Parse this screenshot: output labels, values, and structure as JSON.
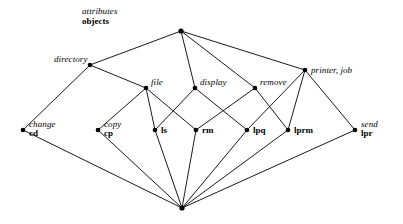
{
  "figure": {
    "kind": "concept-lattice-diagram",
    "background_color": "#ffffff",
    "line_color": "#000000",
    "node_color": "#000000",
    "width": 403,
    "height": 224
  },
  "legend": {
    "attributes_label": "attributes",
    "objects_label": "objects"
  },
  "chart_data": {
    "type": "diagram",
    "title": "",
    "nodes": [
      {
        "id": "top",
        "x": 181,
        "y": 31,
        "attribute": "",
        "object": "",
        "label_pos": "none"
      },
      {
        "id": "directory",
        "x": 90,
        "y": 65,
        "attribute": "directory",
        "object": "",
        "label_pos": "above-left"
      },
      {
        "id": "printer",
        "x": 305,
        "y": 70,
        "attribute": "printer, job",
        "object": "",
        "label_pos": "right"
      },
      {
        "id": "file",
        "x": 146,
        "y": 88,
        "attribute": "file",
        "object": "",
        "label_pos": "above-right"
      },
      {
        "id": "display",
        "x": 195,
        "y": 88,
        "attribute": "display",
        "object": "",
        "label_pos": "above-right"
      },
      {
        "id": "remove",
        "x": 255,
        "y": 88,
        "attribute": "remove",
        "object": "",
        "label_pos": "above-right"
      },
      {
        "id": "cd",
        "x": 23,
        "y": 130,
        "attribute": "change",
        "object": "cd",
        "label_pos": "right"
      },
      {
        "id": "cp",
        "x": 98,
        "y": 130,
        "attribute": "copy",
        "object": "cp",
        "label_pos": "right"
      },
      {
        "id": "ls",
        "x": 155,
        "y": 130,
        "attribute": "",
        "object": "ls",
        "label_pos": "right"
      },
      {
        "id": "rm",
        "x": 196,
        "y": 130,
        "attribute": "",
        "object": "rm",
        "label_pos": "right"
      },
      {
        "id": "lpq",
        "x": 247,
        "y": 130,
        "attribute": "",
        "object": "lpq",
        "label_pos": "right"
      },
      {
        "id": "lprm",
        "x": 288,
        "y": 130,
        "attribute": "",
        "object": "lprm",
        "label_pos": "right"
      },
      {
        "id": "lpr",
        "x": 355,
        "y": 130,
        "attribute": "send",
        "object": "lpr",
        "label_pos": "right"
      },
      {
        "id": "bottom",
        "x": 182,
        "y": 208,
        "attribute": "",
        "object": "",
        "label_pos": "none"
      }
    ],
    "edges": [
      {
        "from": "top",
        "to": "directory"
      },
      {
        "from": "top",
        "to": "display"
      },
      {
        "from": "top",
        "to": "remove"
      },
      {
        "from": "top",
        "to": "printer"
      },
      {
        "from": "directory",
        "to": "file"
      },
      {
        "from": "directory",
        "to": "cd"
      },
      {
        "from": "file",
        "to": "cp"
      },
      {
        "from": "file",
        "to": "ls"
      },
      {
        "from": "file",
        "to": "rm"
      },
      {
        "from": "display",
        "to": "ls"
      },
      {
        "from": "display",
        "to": "lpq"
      },
      {
        "from": "remove",
        "to": "rm"
      },
      {
        "from": "remove",
        "to": "lprm"
      },
      {
        "from": "printer",
        "to": "lpq"
      },
      {
        "from": "printer",
        "to": "lprm"
      },
      {
        "from": "printer",
        "to": "lpr"
      },
      {
        "from": "cd",
        "to": "bottom"
      },
      {
        "from": "cp",
        "to": "bottom"
      },
      {
        "from": "ls",
        "to": "bottom"
      },
      {
        "from": "rm",
        "to": "bottom"
      },
      {
        "from": "lpq",
        "to": "bottom"
      },
      {
        "from": "lprm",
        "to": "bottom"
      },
      {
        "from": "lpr",
        "to": "bottom"
      }
    ]
  }
}
